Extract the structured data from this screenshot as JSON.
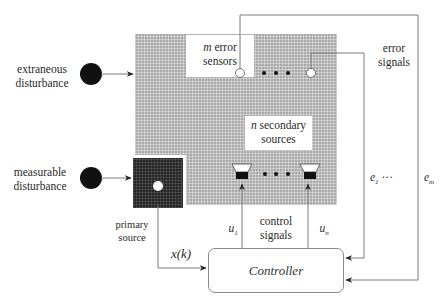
{
  "diagram": {
    "type": "active-noise-control-block-diagram",
    "extraneous_disturbance": {
      "line1": "extraneous",
      "line2": "disturbance"
    },
    "measurable_disturbance": {
      "line1": "measurable",
      "line2": "disturbance"
    },
    "primary_source": {
      "line1": "primary",
      "line2": "source"
    },
    "error_sensors": {
      "count_symbol": "m",
      "line1_rest": " error",
      "line2": "sensors"
    },
    "secondary_sources": {
      "count_symbol": "n",
      "line1_rest": " secondary",
      "line2": "sources"
    },
    "error_signals": {
      "line1": "error",
      "line2": "signals"
    },
    "control_signals": {
      "line1": "control",
      "line2": "signals"
    },
    "reference_signal": "x(k)",
    "u1": {
      "base": "u",
      "sub": "1"
    },
    "un": {
      "base": "u",
      "sub": "n"
    },
    "e1": {
      "base": "e",
      "sub": "1",
      "ellipsis": "···"
    },
    "em": {
      "base": "e",
      "sub": "m"
    },
    "controller": "Controller",
    "ellipsis_dots": "• • •"
  },
  "colors": {
    "plant_gray": "#a9a9a9",
    "primary_dark": "#262626",
    "line": "#777777",
    "disturbance": "#111111"
  }
}
